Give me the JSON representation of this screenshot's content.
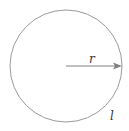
{
  "diagram": {
    "type": "circle-radius",
    "radius_label": "r",
    "circumference_label": "l",
    "colors": {
      "circle_stroke": "#9a9a9a",
      "arrow": "#808080",
      "text": "#333333"
    }
  }
}
